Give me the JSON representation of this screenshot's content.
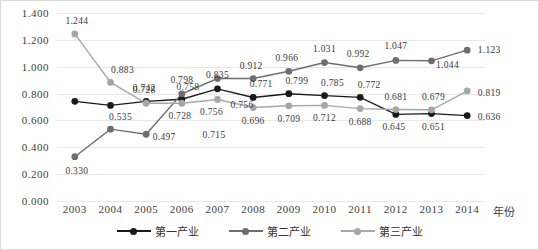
{
  "chart_data": {
    "type": "line",
    "title": "",
    "xlabel": "年份",
    "ylabel": "",
    "categories": [
      "2003",
      "2004",
      "2005",
      "2006",
      "2007",
      "2008",
      "2009",
      "2010",
      "2011",
      "2012",
      "2013",
      "2014"
    ],
    "ylim": [
      0.0,
      1.4
    ],
    "yticks": [
      "0.000",
      "0.200",
      "0.400",
      "0.600",
      "0.800",
      "1.000",
      "1.200",
      "1.400"
    ],
    "ytick_values": [
      0.0,
      0.2,
      0.4,
      0.6,
      0.8,
      1.0,
      1.2,
      1.4
    ],
    "grid": true,
    "legend_position": "bottom",
    "series": [
      {
        "name": "第一产业",
        "color": "#1a1a1a",
        "values": [
          0.742,
          0.712,
          0.742,
          0.758,
          0.835,
          0.771,
          0.799,
          0.785,
          0.772,
          0.645,
          0.651,
          0.636
        ],
        "labels": [
          "",
          "",
          "0.742",
          "0.758",
          "0.835",
          "0.771",
          "0.799",
          "0.785",
          "0.772",
          "0.645",
          "0.651",
          "0.636"
        ]
      },
      {
        "name": "第二产业",
        "color": "#6e6e6e",
        "values": [
          0.33,
          0.535,
          0.497,
          0.798,
          0.912,
          0.912,
          0.966,
          1.031,
          0.992,
          1.047,
          1.044,
          1.123
        ],
        "labels": [
          "0.330",
          "0.535",
          "0.497",
          "0.798",
          "",
          "0.912",
          "0.966",
          "1.031",
          "0.992",
          "1.047",
          "1.044",
          "1.123"
        ]
      },
      {
        "name": "第三产业",
        "color": "#a6a6a6",
        "values": [
          1.244,
          0.883,
          0.728,
          0.728,
          0.756,
          0.696,
          0.709,
          0.712,
          0.688,
          0.681,
          0.679,
          0.819
        ],
        "labels": [
          "1.244",
          "0.883",
          "0.728",
          "0.728",
          "0.756",
          "0.696",
          "0.709",
          "0.712",
          "0.688",
          "0.681",
          "0.679",
          "0.819"
        ]
      }
    ],
    "extra_labels": [
      {
        "text": "0.715",
        "x": 157,
        "y": 122
      },
      {
        "text": "0.756",
        "x": 185,
        "y": 92
      }
    ],
    "label_offsets": {
      "第一产业": [
        [
          0,
          0
        ],
        [
          0,
          0
        ],
        [
          -2,
          -13
        ],
        [
          6,
          -12
        ],
        [
          0,
          -14
        ],
        [
          8,
          -13
        ],
        [
          8,
          -13
        ],
        [
          8,
          -13
        ],
        [
          9,
          -12
        ],
        [
          -2,
          13
        ],
        [
          2,
          13
        ],
        [
          22,
          1
        ]
      ],
      "第二产业": [
        [
          2,
          14
        ],
        [
          10,
          -12
        ],
        [
          18,
          3
        ],
        [
          0,
          -14
        ],
        [
          0,
          0
        ],
        [
          -2,
          -13
        ],
        [
          -2,
          -13
        ],
        [
          0,
          -14
        ],
        [
          -2,
          -14
        ],
        [
          0,
          -14
        ],
        [
          16,
          4
        ],
        [
          22,
          0
        ]
      ],
      "第三产业": [
        [
          2,
          -13
        ],
        [
          12,
          -12
        ],
        [
          -2,
          -13
        ],
        [
          -2,
          13
        ],
        [
          -6,
          13
        ],
        [
          0,
          13
        ],
        [
          0,
          13
        ],
        [
          0,
          13
        ],
        [
          0,
          13
        ],
        [
          0,
          -13
        ],
        [
          2,
          -13
        ],
        [
          22,
          2
        ]
      ]
    }
  },
  "axis": {
    "x_title": "年份"
  }
}
